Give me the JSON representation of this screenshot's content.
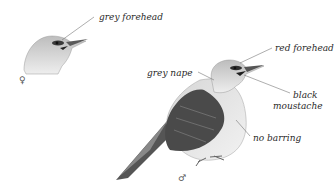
{
  "female": {
    "symbol": "♀",
    "labels": {
      "forehead": "grey forehead"
    }
  },
  "male": {
    "symbol": "♂",
    "labels": {
      "forehead": "red forehead",
      "nape": "grey nape",
      "moustache_line1": "black",
      "moustache_line2": "moustache",
      "belly": "no barring"
    }
  },
  "colors": {
    "background": "#ffffff",
    "plumage_grey": "#c9c9c9",
    "wing_dark": "#4a4a4a",
    "leader_line": "#777777",
    "label_text": "#2a2a2a"
  }
}
